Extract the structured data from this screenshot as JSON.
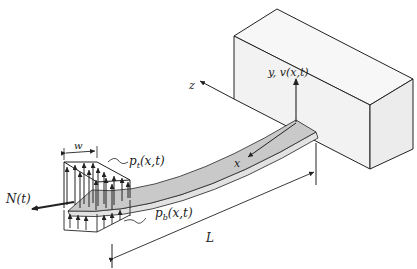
{
  "figure": {
    "labels": {
      "displacement_axis": "y, v(x,t)",
      "z_axis": "z",
      "x_axis": "x",
      "top_load": "p",
      "top_load_sub": "t",
      "top_load_args": "(x,t)",
      "bottom_load": "p",
      "bottom_load_sub": "b",
      "bottom_load_args": "(x,t)",
      "axial_force": "N(t)",
      "patch_width": "w",
      "length": "L"
    },
    "colors": {
      "line": "#222222",
      "beam_top": "#c9c9c9",
      "beam_side": "#e2e2e2",
      "block_face": "#f2f2f2",
      "block_top": "#f7f7f7",
      "block_side": "#ececec",
      "background": "#ffffff"
    }
  }
}
